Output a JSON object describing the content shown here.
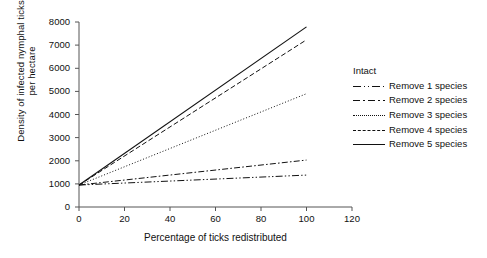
{
  "chart_data": {
    "type": "line",
    "title": "",
    "xlabel": "Percentage of ticks redistributed",
    "ylabel_line1": "Density of infected nymphal ticks",
    "ylabel_line2": "per hectare",
    "xlim": [
      0,
      120
    ],
    "ylim": [
      0,
      8000
    ],
    "xticks": [
      "0",
      "20",
      "40",
      "60",
      "80",
      "100",
      "120"
    ],
    "xtick_values": [
      0,
      20,
      40,
      60,
      80,
      100,
      120
    ],
    "yticks": [
      "0",
      "1000",
      "2000",
      "3000",
      "4000",
      "5000",
      "6000",
      "7000",
      "8000"
    ],
    "ytick_values": [
      0,
      1000,
      2000,
      3000,
      4000,
      5000,
      6000,
      7000,
      8000
    ],
    "grid": false,
    "legend_position": "right",
    "x": [
      0,
      100
    ],
    "series": [
      {
        "name": "Intact",
        "style": "none",
        "values": [
          1000,
          1000
        ]
      },
      {
        "name": "Remove 1 species",
        "style": "dashdotdot",
        "values": [
          950,
          1380
        ]
      },
      {
        "name": "Remove 2 species",
        "style": "dashdot",
        "values": [
          950,
          2030
        ]
      },
      {
        "name": "Remove 3 species",
        "style": "dotted",
        "values": [
          950,
          4900
        ]
      },
      {
        "name": "Remove 4 species",
        "style": "dashed",
        "values": [
          950,
          7230
        ]
      },
      {
        "name": "Remove 5 species",
        "style": "solid",
        "values": [
          950,
          7790
        ]
      }
    ],
    "line_color": "#111111",
    "axis_color": "#555555"
  },
  "legend": {
    "entries": [
      {
        "label": "Intact"
      },
      {
        "label": "Remove 1 species"
      },
      {
        "label": "Remove 2 species"
      },
      {
        "label": "Remove 3 species"
      },
      {
        "label": "Remove 4 species"
      },
      {
        "label": "Remove 5 species"
      }
    ]
  }
}
